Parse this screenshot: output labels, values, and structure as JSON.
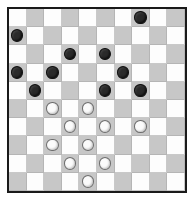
{
  "board": {
    "title": "Draughts Board",
    "game": "International Draughts",
    "rows": 10,
    "columns": 10,
    "dark_square_rule": "(row + column) is odd",
    "colors": {
      "light_square": "#fdfdfd",
      "dark_square": "#c7c7c7",
      "border": "#1a1a1a",
      "black_piece": "#2a2a2a",
      "white_piece": "#fbfbfb",
      "background": "#ffffff"
    },
    "counts": {
      "black_pieces": 10,
      "white_pieces": 10,
      "total_pieces": 20
    },
    "pieces": [
      {
        "row": 0,
        "col": 7,
        "color": "black"
      },
      {
        "row": 1,
        "col": 0,
        "color": "black"
      },
      {
        "row": 2,
        "col": 3,
        "color": "black"
      },
      {
        "row": 2,
        "col": 5,
        "color": "black"
      },
      {
        "row": 3,
        "col": 0,
        "color": "black"
      },
      {
        "row": 3,
        "col": 2,
        "color": "black"
      },
      {
        "row": 3,
        "col": 6,
        "color": "black"
      },
      {
        "row": 4,
        "col": 1,
        "color": "black"
      },
      {
        "row": 4,
        "col": 5,
        "color": "black"
      },
      {
        "row": 4,
        "col": 7,
        "color": "black"
      },
      {
        "row": 5,
        "col": 2,
        "color": "white"
      },
      {
        "row": 5,
        "col": 4,
        "color": "white"
      },
      {
        "row": 6,
        "col": 3,
        "color": "white"
      },
      {
        "row": 6,
        "col": 5,
        "color": "white"
      },
      {
        "row": 6,
        "col": 7,
        "color": "white"
      },
      {
        "row": 7,
        "col": 2,
        "color": "white"
      },
      {
        "row": 7,
        "col": 4,
        "color": "white"
      },
      {
        "row": 8,
        "col": 3,
        "color": "white"
      },
      {
        "row": 8,
        "col": 5,
        "color": "white"
      },
      {
        "row": 9,
        "col": 4,
        "color": "white"
      }
    ]
  }
}
